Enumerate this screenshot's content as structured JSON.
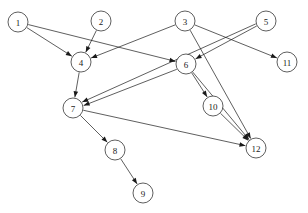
{
  "graph": {
    "type": "directed-graph",
    "width": 308,
    "height": 213,
    "background_color": "#ffffff",
    "stroke_color": "#1a1a1a",
    "node_radius": 10,
    "nodes": [
      {
        "id": "1",
        "label": "1",
        "x": 18,
        "y": 22
      },
      {
        "id": "2",
        "label": "2",
        "x": 101,
        "y": 21
      },
      {
        "id": "3",
        "label": "3",
        "x": 185,
        "y": 21
      },
      {
        "id": "5",
        "label": "5",
        "x": 266,
        "y": 21
      },
      {
        "id": "4",
        "label": "4",
        "x": 81,
        "y": 62
      },
      {
        "id": "6",
        "label": "6",
        "x": 186,
        "y": 64
      },
      {
        "id": "11",
        "label": "11",
        "x": 287,
        "y": 62
      },
      {
        "id": "7",
        "label": "7",
        "x": 73,
        "y": 108
      },
      {
        "id": "10",
        "label": "10",
        "x": 213,
        "y": 106
      },
      {
        "id": "8",
        "label": "8",
        "x": 115,
        "y": 150
      },
      {
        "id": "12",
        "label": "12",
        "x": 256,
        "y": 148
      },
      {
        "id": "9",
        "label": "9",
        "x": 143,
        "y": 193
      }
    ],
    "edges": [
      {
        "from": "1",
        "to": "4",
        "offset": 0
      },
      {
        "from": "1",
        "to": "6",
        "offset": 0
      },
      {
        "from": "2",
        "to": "4",
        "offset": 0
      },
      {
        "from": "3",
        "to": "4",
        "offset": 0
      },
      {
        "from": "3",
        "to": "11",
        "offset": 0
      },
      {
        "from": "3",
        "to": "12",
        "offset": 0
      },
      {
        "from": "5",
        "to": "6",
        "offset": 0
      },
      {
        "from": "5",
        "to": "7",
        "offset": 1.6
      },
      {
        "from": "4",
        "to": "7",
        "offset": 0
      },
      {
        "from": "6",
        "to": "7",
        "offset": -1.6
      },
      {
        "from": "6",
        "to": "10",
        "offset": 0
      },
      {
        "from": "6",
        "to": "12",
        "offset": 0
      },
      {
        "from": "7",
        "to": "8",
        "offset": 0
      },
      {
        "from": "7",
        "to": "12",
        "offset": 0
      },
      {
        "from": "8",
        "to": "9",
        "offset": 0
      },
      {
        "from": "10",
        "to": "12",
        "offset": 0
      }
    ]
  }
}
